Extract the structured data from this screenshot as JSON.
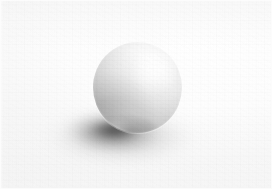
{
  "image": {
    "subject": "matte white sphere",
    "setting": "seamless pale gray studio backdrop",
    "caption": "A matte white sphere resting on a seamless light gray surface, lit from the upper right and casting a soft elliptical shadow toward the lower left.",
    "medium": "photograph",
    "palette": {
      "background": "#fbfbfb",
      "backdrop_highlight": "#ffffff",
      "backdrop_shade": "#f2f2f2",
      "sphere_highlight": "#fefefe",
      "sphere_midtone": "#dedede",
      "sphere_terminator": "#a8a8a8",
      "shadow_core": "#3e3e3e",
      "shadow_edge": "#c8c8c8"
    },
    "frame": {
      "width": 272,
      "height": 189
    }
  },
  "sphere": {
    "label": "sphere",
    "center_x": 137,
    "center_y": 88,
    "diameter": 90,
    "light_direction": "upper right",
    "highlight_x_pct": 63,
    "highlight_y_pct": 26,
    "finish": "matte"
  },
  "shadow": {
    "label": "cast shadow",
    "center_x": 122,
    "center_y": 131,
    "width": 176,
    "height": 62,
    "direction": "lower left",
    "softness": "soft"
  },
  "backdrop": {
    "label": "backdrop",
    "type": "seamless sweep",
    "texture": "fine paper grain"
  }
}
